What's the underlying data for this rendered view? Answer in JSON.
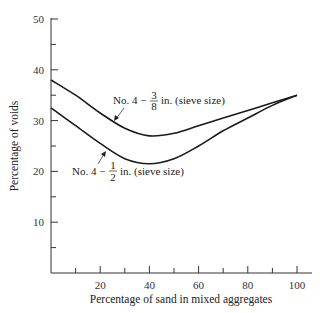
{
  "chart_data": {
    "type": "line",
    "title": "",
    "xlabel": "Percentage of sand in mixed aggregates",
    "ylabel": "Percentage of voids",
    "xlim": [
      0,
      100
    ],
    "ylim": [
      0,
      50
    ],
    "x_ticks": [
      "20",
      "40",
      "60",
      "80",
      "100"
    ],
    "y_ticks": [
      "10",
      "20",
      "30",
      "40",
      "50"
    ],
    "grid": false,
    "legend": "inline annotations",
    "series": [
      {
        "name": "No. 4 − 3/8 in. (sieve size)",
        "x": [
          0,
          10,
          20,
          30,
          40,
          50,
          60,
          70,
          80,
          90,
          100
        ],
        "y": [
          38,
          35,
          31.5,
          28.5,
          27,
          27.5,
          29,
          30.5,
          32,
          33.5,
          35
        ]
      },
      {
        "name": "No. 4 − 1/2 in. (sieve size)",
        "x": [
          0,
          10,
          20,
          30,
          40,
          50,
          60,
          70,
          80,
          90,
          100
        ],
        "y": [
          32.5,
          29,
          25.5,
          22.5,
          21.5,
          22.5,
          25,
          28,
          30.5,
          33,
          35
        ]
      }
    ]
  },
  "annotations": {
    "upper_prefix": "No. 4 −",
    "upper_num": "3",
    "upper_den": "8",
    "upper_suffix": "in. (sieve size)",
    "lower_prefix": "No. 4 −",
    "lower_num": "1",
    "lower_den": "2",
    "lower_suffix": "in. (sieve size)"
  }
}
